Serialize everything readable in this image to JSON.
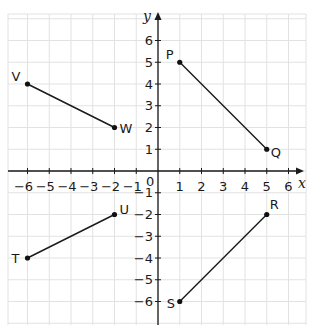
{
  "diagram": {
    "type": "coordinate-plane",
    "axes": {
      "x_label": "x",
      "y_label": "y",
      "origin_label": "0",
      "x_ticks": [
        -6,
        -5,
        -4,
        -3,
        -2,
        -1,
        1,
        2,
        3,
        4,
        5,
        6
      ],
      "y_ticks": [
        6,
        5,
        4,
        3,
        2,
        1,
        -1,
        -2,
        -3,
        -4,
        -5,
        -6
      ],
      "range": {
        "xmin": -7,
        "xmax": 6.9,
        "ymin": -7,
        "ymax": 7.2
      },
      "grid": true
    },
    "segments": [
      {
        "name": "VW",
        "from": {
          "label": "V",
          "x": -6,
          "y": 4
        },
        "to": {
          "label": "W",
          "x": -2,
          "y": 2
        }
      },
      {
        "name": "PQ",
        "from": {
          "label": "P",
          "x": 1,
          "y": 5
        },
        "to": {
          "label": "Q",
          "x": 5,
          "y": 1
        }
      },
      {
        "name": "TU",
        "from": {
          "label": "T",
          "x": -6,
          "y": -4
        },
        "to": {
          "label": "U",
          "x": -2,
          "y": -2
        }
      },
      {
        "name": "SR",
        "from": {
          "label": "S",
          "x": 1,
          "y": -6
        },
        "to": {
          "label": "R",
          "x": 5,
          "y": -2
        }
      }
    ],
    "colors": {
      "grid": "#e2e2e2",
      "axis": "#1a1a1a",
      "segment": "#1a1a1a",
      "point": "#111111",
      "text": "#1a1a1a"
    }
  }
}
